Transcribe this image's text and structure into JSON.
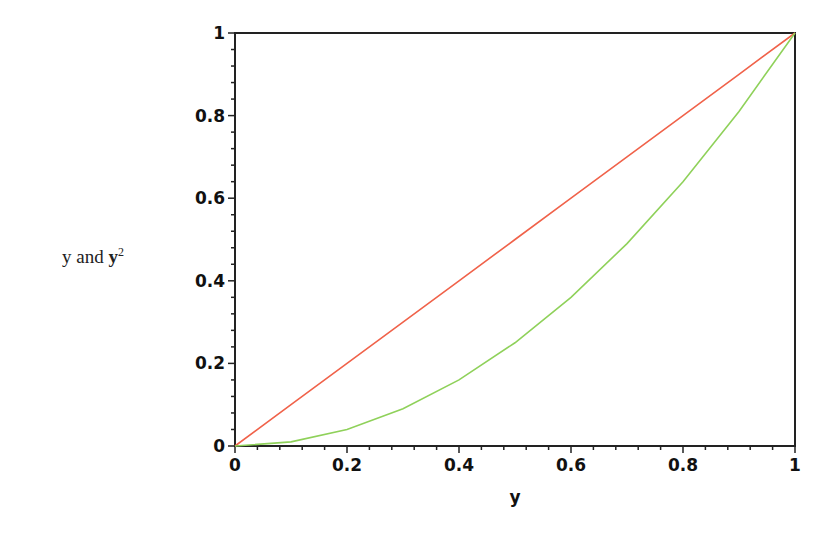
{
  "chart_data": {
    "type": "line",
    "title": "",
    "xlabel": "y",
    "ylabel": "y and y^2",
    "ylabel_parts": {
      "plain": "y and ",
      "bold": "y",
      "sup": "2"
    },
    "xlim": [
      0,
      1
    ],
    "ylim": [
      0,
      1
    ],
    "grid": false,
    "legend": null,
    "x_ticks": [
      "0",
      "0.2",
      "0.4",
      "0.6",
      "0.8",
      "1"
    ],
    "y_ticks": [
      "0",
      "0.2",
      "0.4",
      "0.6",
      "0.8",
      "1"
    ],
    "x": [
      0,
      0.1,
      0.2,
      0.3,
      0.4,
      0.5,
      0.6,
      0.7,
      0.8,
      0.9,
      1.0
    ],
    "series": [
      {
        "name": "y",
        "color": "#f0624a",
        "values": [
          0,
          0.1,
          0.2,
          0.3,
          0.4,
          0.5,
          0.6,
          0.7,
          0.8,
          0.9,
          1.0
        ]
      },
      {
        "name": "y^2",
        "color": "#8fd15a",
        "values": [
          0,
          0.01,
          0.04,
          0.09,
          0.16,
          0.25,
          0.36,
          0.49,
          0.64,
          0.81,
          1.0
        ]
      }
    ]
  }
}
